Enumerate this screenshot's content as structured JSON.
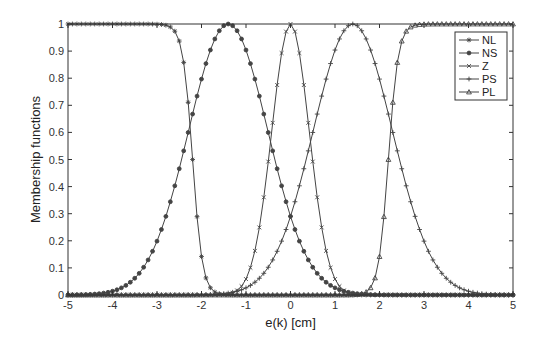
{
  "chart_data": {
    "type": "line",
    "title": "",
    "xlabel": "e(k) [cm]",
    "ylabel": "Membership functions",
    "xlim": [
      -5,
      5
    ],
    "ylim": [
      0,
      1
    ],
    "xticks": [
      -5,
      -4,
      -3,
      -2,
      -1,
      0,
      1,
      2,
      3,
      4,
      5
    ],
    "yticks": [
      0,
      0.1,
      0.2,
      0.3,
      0.4,
      0.5,
      0.6,
      0.7,
      0.8,
      0.9,
      1
    ],
    "ytick_labels": [
      "0",
      "0.1",
      "0.2",
      "0.3",
      "0.4",
      "0.5",
      "0.6",
      "0.7",
      "0.8",
      "0.9",
      "1"
    ],
    "xtick_labels": [
      "-5",
      "-4",
      "-3",
      "-2",
      "-1",
      "0",
      "1",
      "2",
      "3",
      "4",
      "5"
    ],
    "grid": false,
    "legend_position": "upper right",
    "line_color": "#444444",
    "series": [
      {
        "name": "NL",
        "marker": "star",
        "shape": "sigmoid-decreasing",
        "center": -2.2,
        "slope": 9,
        "x": [
          -5,
          -4,
          -3,
          -2.6,
          -2.4,
          -2.2,
          -2.0,
          -1.8,
          -1.5,
          -1,
          0,
          5
        ],
        "values": [
          1,
          1,
          1,
          0.97,
          0.86,
          0.5,
          0.14,
          0.03,
          0,
          0,
          0,
          0
        ]
      },
      {
        "name": "NS",
        "marker": "filled-circle",
        "shape": "gaussian",
        "center": -1.4,
        "sigma": 0.89,
        "x": [
          -5,
          -4,
          -3,
          -2,
          -1.4,
          -1,
          0,
          1,
          2,
          5
        ],
        "values": [
          0.0,
          0.01,
          0.2,
          0.8,
          1.0,
          0.9,
          0.29,
          0.03,
          0.0,
          0.0
        ]
      },
      {
        "name": "Z",
        "marker": "x",
        "shape": "gaussian",
        "center": 0,
        "sigma": 0.42,
        "x": [
          -5,
          -1.5,
          -1,
          -0.5,
          0,
          0.5,
          1,
          1.5,
          5
        ],
        "values": [
          0,
          0.0,
          0.06,
          0.49,
          1.0,
          0.49,
          0.06,
          0.0,
          0
        ]
      },
      {
        "name": "PS",
        "marker": "plus",
        "shape": "gaussian",
        "center": 1.4,
        "sigma": 0.89,
        "x": [
          -5,
          -2,
          -1,
          0,
          1,
          1.4,
          2,
          3,
          4,
          5
        ],
        "values": [
          0.0,
          0.0,
          0.03,
          0.29,
          0.9,
          1.0,
          0.8,
          0.2,
          0.01,
          0.0
        ]
      },
      {
        "name": "PL",
        "marker": "triangle",
        "shape": "sigmoid-increasing",
        "center": 2.2,
        "slope": 9,
        "x": [
          -5,
          0,
          1,
          1.5,
          1.8,
          2.0,
          2.2,
          2.4,
          2.6,
          3,
          4,
          5
        ],
        "values": [
          0,
          0,
          0,
          0,
          0.03,
          0.14,
          0.5,
          0.86,
          0.97,
          1,
          1,
          1
        ]
      }
    ]
  }
}
